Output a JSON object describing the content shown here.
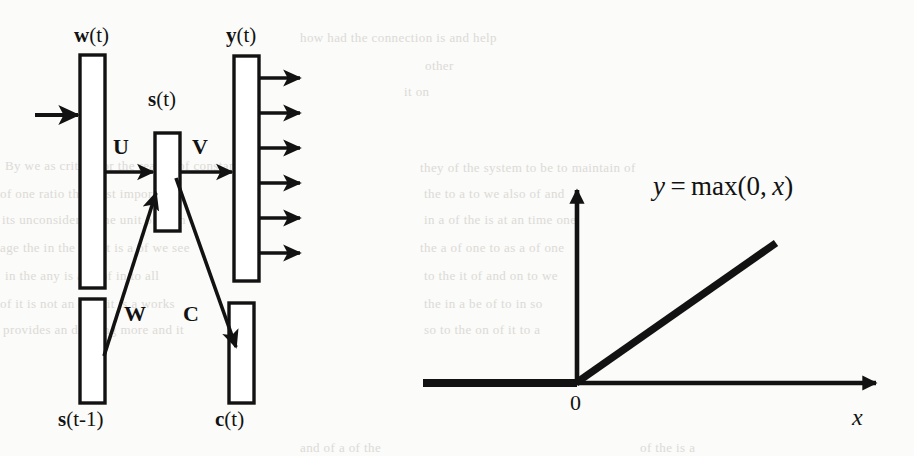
{
  "figure": {
    "kind": "two-panel-scanned-figure",
    "background_color": "#fbfbf9",
    "ink_color": "#121212",
    "left_panel": {
      "name": "recurrent-neural-network-with-class-layer",
      "layers": [
        {
          "id": "w",
          "label_bold": "w",
          "label_rest": "(t)",
          "label_full": "w(t)",
          "label_position": "top"
        },
        {
          "id": "s",
          "label_bold": "s",
          "label_rest": "(t)",
          "label_full": "s(t)",
          "label_position": "top"
        },
        {
          "id": "y",
          "label_bold": "y",
          "label_rest": "(t)",
          "label_full": "y(t)",
          "label_position": "top"
        },
        {
          "id": "sprev",
          "label_bold": "s",
          "label_rest": "(t-1)",
          "label_full": "s(t-1)",
          "label_position": "bottom"
        },
        {
          "id": "c",
          "label_bold": "c",
          "label_rest": "(t)",
          "label_full": "c(t)",
          "label_position": "bottom"
        }
      ],
      "weight_labels": [
        {
          "id": "U",
          "label": "U",
          "from": "w(t)",
          "to": "s(t)"
        },
        {
          "id": "V",
          "label": "V",
          "from": "s(t)",
          "to": "y(t)"
        },
        {
          "id": "W",
          "label": "W",
          "from": "s(t-1)",
          "to": "s(t)"
        },
        {
          "id": "C",
          "label": "C",
          "from": "s(t)",
          "to": "c(t)"
        }
      ],
      "output_arrow_count": 6,
      "input_arrow_count": 1
    },
    "right_panel": {
      "name": "relu-activation-plot",
      "equation": "y = max(0, x)",
      "equation_parts": {
        "lhs": "y",
        "eq": "=",
        "fn": "max",
        "args": "(0, x)"
      },
      "x_axis_label": "x",
      "y_axis_label": "",
      "origin_label": "0"
    }
  },
  "chart_data": {
    "type": "line",
    "xlabel": "x",
    "ylabel": "",
    "x": [
      -3,
      -2,
      -1,
      0,
      1,
      2,
      3
    ],
    "y": [
      0,
      0,
      0,
      0,
      1,
      2,
      3
    ],
    "series": [
      {
        "name": "y = max(0, x)",
        "values": [
          0,
          0,
          0,
          0,
          1,
          2,
          3
        ]
      }
    ],
    "annotations": [
      "y = max(0, x)",
      "0",
      "x"
    ],
    "xlim": [
      -3.3,
      3.6
    ],
    "ylim": [
      -0.3,
      3.2
    ],
    "grid": false,
    "legend": "none",
    "axes": "arrow-style cartesian through origin",
    "line_color": "#121212",
    "line_width_px": 7
  },
  "bleed_text": {
    "note": "faint reverse-side print showing through the scanned page",
    "lines": [
      {
        "text": "how had the connection is and help",
        "x": 300,
        "y": 30
      },
      {
        "text": "other",
        "x": 425,
        "y": 58
      },
      {
        "text": "it  on",
        "x": 404,
        "y": 84
      },
      {
        "text": "By we as critical or the reality of constant",
        "x": 5,
        "y": 158
      },
      {
        "text": "of one ratio the most important",
        "x": 0,
        "y": 186
      },
      {
        "text": "its unconsider or the unit of each",
        "x": 2,
        "y": 212
      },
      {
        "text": "age the in the and it is a of we see",
        "x": 0,
        "y": 240
      },
      {
        "text": "in the  any is  and of  in to all",
        "x": 5,
        "y": 268
      },
      {
        "text": "of it  is not an of  is it is a works",
        "x": 0,
        "y": 296
      },
      {
        "text": "provides an drawing more and  it",
        "x": 3,
        "y": 322
      },
      {
        "text": "they of the system to be to maintain of",
        "x": 420,
        "y": 160
      },
      {
        "text": "the  to  a  to  we  also  of  and",
        "x": 424,
        "y": 186
      },
      {
        "text": "in  a  of  the  is  at  an  time  one",
        "x": 424,
        "y": 212
      },
      {
        "text": "the  a  of  one  to  as  a  of  one",
        "x": 420,
        "y": 240
      },
      {
        "text": "to  the  it  of  and  on  to  we",
        "x": 424,
        "y": 268
      },
      {
        "text": "the   in   a   be   of   to   in   so",
        "x": 424,
        "y": 296
      },
      {
        "text": "so  to  the  on  of  it  to  a",
        "x": 424,
        "y": 322
      },
      {
        "text": "and  of  a  of  the",
        "x": 300,
        "y": 440
      },
      {
        "text": "of the  is  a",
        "x": 640,
        "y": 440
      }
    ]
  }
}
